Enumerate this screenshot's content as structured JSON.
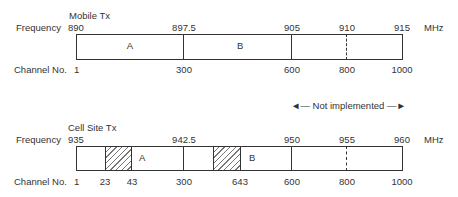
{
  "mobile": {
    "title": "Mobile Tx",
    "freq_label": "Frequency",
    "chan_label": "Channel No.",
    "unit": "MHz",
    "freqs": [
      "890",
      "897.5",
      "905",
      "910",
      "915"
    ],
    "chans": [
      "1",
      "300",
      "600",
      "800",
      "1000"
    ],
    "bands": [
      "A",
      "B"
    ]
  },
  "cell": {
    "title": "Cell Site Tx",
    "freq_label": "Frequency",
    "chan_label": "Channel No.",
    "unit": "MHz",
    "freqs": [
      "935",
      "942.5",
      "950",
      "955",
      "960"
    ],
    "chans": [
      "1",
      "23",
      "43",
      "300",
      "643",
      "600",
      "800",
      "1000"
    ],
    "bands": [
      "A",
      "B"
    ]
  },
  "note": "◄— Not implemented —►"
}
